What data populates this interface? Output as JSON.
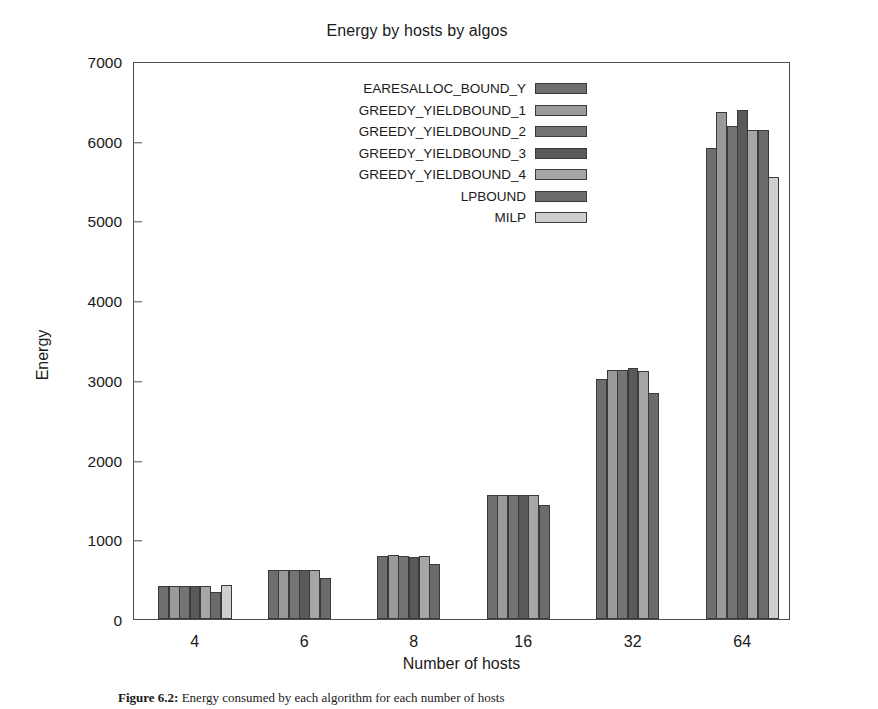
{
  "figure": {
    "title": "Energy by hosts by algos",
    "caption_prefix": "Figure 6.2:",
    "caption_text": "Energy consumed by each algorithm for each number of hosts"
  },
  "axes": {
    "xlabel": "Number of hosts",
    "ylabel": "Energy",
    "yticks": [
      "0",
      "1000",
      "2000",
      "3000",
      "4000",
      "5000",
      "6000",
      "7000"
    ],
    "xticks": [
      "4",
      "6",
      "8",
      "16",
      "32",
      "64"
    ],
    "ylim": [
      0,
      7000
    ],
    "grid": false
  },
  "legend": {
    "position": "upper-center",
    "entries": [
      {
        "label": "EARESALLOC_BOUND_Y",
        "color": "#6e6e6e"
      },
      {
        "label": "GREEDY_YIELDBOUND_1",
        "color": "#9a9a9a"
      },
      {
        "label": "GREEDY_YIELDBOUND_2",
        "color": "#747474"
      },
      {
        "label": "GREEDY_YIELDBOUND_3",
        "color": "#5a5a5a"
      },
      {
        "label": "GREEDY_YIELDBOUND_4",
        "color": "#a6a6a6"
      },
      {
        "label": "LPBOUND",
        "color": "#6b6b6b"
      },
      {
        "label": "MILP",
        "color": "#cfcfcf"
      }
    ]
  },
  "chart_data": {
    "type": "bar",
    "title": "Energy by hosts by algos",
    "xlabel": "Number of hosts",
    "ylabel": "Energy",
    "ylim": [
      0,
      7000
    ],
    "ytick_step": 1000,
    "grid": false,
    "legend_position": "upper-center",
    "categories": [
      "4",
      "6",
      "8",
      "16",
      "32",
      "64"
    ],
    "series": [
      {
        "name": "EARESALLOC_BOUND_Y",
        "color": "#6e6e6e",
        "values": [
          415,
          610,
          795,
          1550,
          3005,
          5910
        ]
      },
      {
        "name": "GREEDY_YIELDBOUND_1",
        "color": "#9a9a9a",
        "values": [
          420,
          620,
          800,
          1560,
          3120,
          6355
        ]
      },
      {
        "name": "GREEDY_YIELDBOUND_2",
        "color": "#747474",
        "values": [
          415,
          615,
          790,
          1555,
          3125,
          6190
        ]
      },
      {
        "name": "GREEDY_YIELDBOUND_3",
        "color": "#5a5a5a",
        "values": [
          420,
          620,
          780,
          1560,
          3150,
          6380
        ]
      },
      {
        "name": "GREEDY_YIELDBOUND_4",
        "color": "#a6a6a6",
        "values": [
          415,
          615,
          790,
          1555,
          3110,
          6130
        ]
      },
      {
        "name": "LPBOUND",
        "color": "#6b6b6b",
        "values": [
          340,
          520,
          690,
          1430,
          2840,
          6130
        ]
      },
      {
        "name": "MILP",
        "color": "#cfcfcf",
        "values": [
          425,
          0,
          0,
          0,
          0,
          5540
        ]
      }
    ]
  }
}
